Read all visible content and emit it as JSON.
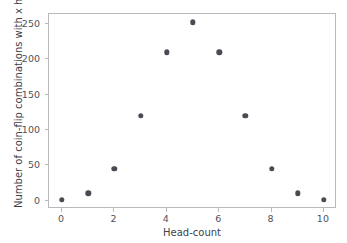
{
  "chart_data": {
    "type": "scatter",
    "title": "",
    "xlabel": "Head-count",
    "ylabel": "Number of coin-flip combinations with x heads",
    "x": [
      0,
      1,
      2,
      3,
      4,
      5,
      6,
      7,
      8,
      9,
      10
    ],
    "values": [
      1,
      10,
      45,
      120,
      210,
      252,
      210,
      120,
      45,
      10,
      1
    ],
    "series": [
      {
        "name": "coin-flip combinations",
        "values": [
          1,
          10,
          45,
          120,
          210,
          252,
          210,
          120,
          45,
          10,
          1
        ]
      }
    ],
    "xlim": [
      -0.5,
      10.5
    ],
    "ylim": [
      -12,
      264
    ],
    "xticks": [
      0,
      2,
      4,
      6,
      8,
      10
    ],
    "xtick_labels": [
      "0",
      "2",
      "4",
      "6",
      "8",
      "10"
    ],
    "yticks": [
      0,
      50,
      100,
      150,
      200,
      250
    ],
    "ytick_labels": [
      "0",
      "50",
      "100",
      "150",
      "200",
      "250"
    ],
    "grid": false,
    "legend": null,
    "marker_color": "#4a4a52",
    "background_color": "#ffffff",
    "spine_color": "#b8b8bd"
  }
}
